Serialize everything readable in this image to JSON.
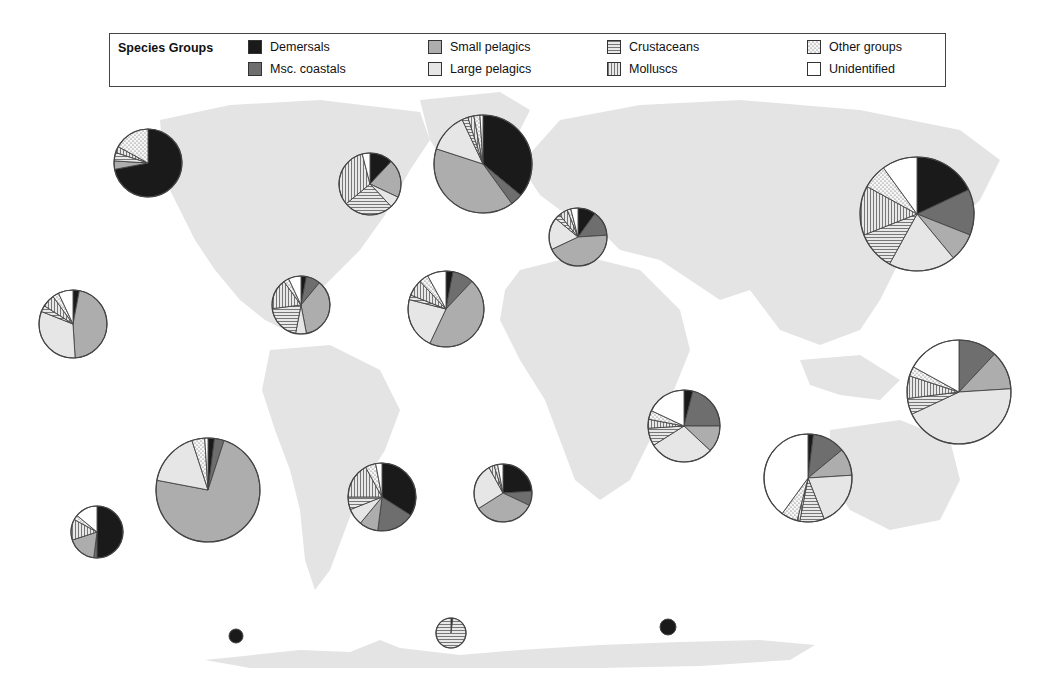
{
  "legend": {
    "title": "Species Groups",
    "items": [
      {
        "key": "dem",
        "label": "Demersals",
        "pattern": "solid",
        "color": "#1a1a1a",
        "col": 0,
        "row": 0
      },
      {
        "key": "msc",
        "label": "Msc. coastals",
        "pattern": "solid",
        "color": "#6e6e6e",
        "col": 0,
        "row": 1
      },
      {
        "key": "spel",
        "label": "Small pelagics",
        "pattern": "solid",
        "color": "#adadad",
        "col": 1,
        "row": 0
      },
      {
        "key": "lpel",
        "label": "Large pelagics",
        "pattern": "solid",
        "color": "#e6e6e6",
        "col": 1,
        "row": 1
      },
      {
        "key": "crus",
        "label": "Crustaceans",
        "pattern": "hlines",
        "color": "#bdbdbd",
        "col": 2,
        "row": 0
      },
      {
        "key": "moll",
        "label": "Molluscs",
        "pattern": "vlines",
        "color": "#bdbdbd",
        "col": 2,
        "row": 1
      },
      {
        "key": "oth",
        "label": "Other groups",
        "pattern": "dots",
        "color": "#efefef",
        "col": 3,
        "row": 0
      },
      {
        "key": "unid",
        "label": "Unidentified",
        "pattern": "solid",
        "color": "#ffffff",
        "col": 3,
        "row": 1
      }
    ]
  },
  "colors": {
    "land": "#e4e4e4",
    "pie_stroke": "#444444",
    "legend_border": "#444444"
  },
  "chart_data": {
    "type": "pie",
    "legend_position": "top",
    "categories": [
      "Demersals",
      "Msc. coastals",
      "Small pelagics",
      "Large pelagics",
      "Crustaceans",
      "Molluscs",
      "Other groups",
      "Unidentified"
    ],
    "pies": [
      {
        "area": "Arctic Sea / NE Pacific north",
        "cx": 148,
        "cy": 163,
        "r": 34,
        "values": {
          "dem": 72,
          "msc": 0,
          "spel": 4,
          "lpel": 0,
          "crus": 4,
          "moll": 3,
          "oth": 17,
          "unid": 0
        }
      },
      {
        "area": "NW Atlantic",
        "cx": 370,
        "cy": 184,
        "r": 31,
        "values": {
          "dem": 12,
          "msc": 0,
          "spel": 20,
          "lpel": 6,
          "crus": 26,
          "moll": 32,
          "oth": 0,
          "unid": 4
        }
      },
      {
        "area": "NE Atlantic",
        "cx": 483,
        "cy": 164,
        "r": 49,
        "values": {
          "dem": 36,
          "msc": 4,
          "spel": 40,
          "lpel": 13,
          "crus": 2,
          "moll": 2,
          "oth": 2,
          "unid": 1
        }
      },
      {
        "area": "Mediterranean & Black Sea",
        "cx": 578,
        "cy": 237,
        "r": 29,
        "values": {
          "dem": 10,
          "msc": 14,
          "spel": 44,
          "lpel": 18,
          "crus": 3,
          "moll": 5,
          "oth": 2,
          "unid": 4
        }
      },
      {
        "area": "NW Pacific",
        "cx": 917,
        "cy": 214,
        "r": 57,
        "values": {
          "dem": 18,
          "msc": 13,
          "spel": 8,
          "lpel": 19,
          "crus": 11,
          "moll": 14,
          "oth": 7,
          "unid": 10
        }
      },
      {
        "area": "NE Pacific",
        "cx": 73,
        "cy": 324,
        "r": 34,
        "values": {
          "dem": 3,
          "msc": 0,
          "spel": 46,
          "lpel": 32,
          "crus": 3,
          "moll": 6,
          "oth": 3,
          "unid": 7
        }
      },
      {
        "area": "Western Central Atlantic",
        "cx": 301,
        "cy": 305,
        "r": 29,
        "values": {
          "dem": 3,
          "msc": 8,
          "spel": 36,
          "lpel": 6,
          "crus": 20,
          "moll": 17,
          "oth": 3,
          "unid": 7
        }
      },
      {
        "area": "Eastern Central Atlantic",
        "cx": 446,
        "cy": 309,
        "r": 38,
        "values": {
          "dem": 3,
          "msc": 9,
          "spel": 45,
          "lpel": 22,
          "crus": 2,
          "moll": 7,
          "oth": 4,
          "unid": 8
        }
      },
      {
        "area": "Western Indian Ocean",
        "cx": 684,
        "cy": 426,
        "r": 36,
        "values": {
          "dem": 4,
          "msc": 21,
          "spel": 12,
          "lpel": 29,
          "crus": 8,
          "moll": 4,
          "oth": 4,
          "unid": 18
        }
      },
      {
        "area": "Eastern Indian Ocean",
        "cx": 959,
        "cy": 392,
        "r": 52,
        "values": {
          "dem": 0,
          "msc": 12,
          "spel": 12,
          "lpel": 44,
          "crus": 5,
          "moll": 7,
          "oth": 3,
          "unid": 17
        }
      },
      {
        "area": "Eastern Central Pacific",
        "cx": 208,
        "cy": 490,
        "r": 52,
        "values": {
          "dem": 2,
          "msc": 3,
          "spel": 73,
          "lpel": 17,
          "crus": 0,
          "moll": 0,
          "oth": 4,
          "unid": 1
        }
      },
      {
        "area": "SW Atlantic",
        "cx": 382,
        "cy": 497,
        "r": 34,
        "values": {
          "dem": 34,
          "msc": 18,
          "spel": 9,
          "lpel": 8,
          "crus": 6,
          "moll": 17,
          "oth": 5,
          "unid": 3
        }
      },
      {
        "area": "SE Atlantic",
        "cx": 503,
        "cy": 493,
        "r": 29,
        "values": {
          "dem": 24,
          "msc": 8,
          "spel": 34,
          "lpel": 26,
          "crus": 0,
          "moll": 3,
          "oth": 2,
          "unid": 3
        }
      },
      {
        "area": "Western Central Pacific / Southern Indian",
        "cx": 808,
        "cy": 478,
        "r": 44,
        "values": {
          "dem": 2,
          "msc": 12,
          "spel": 10,
          "lpel": 20,
          "crus": 9,
          "moll": 1,
          "oth": 6,
          "unid": 40
        }
      },
      {
        "area": "SE Pacific",
        "cx": 97,
        "cy": 532,
        "r": 26,
        "values": {
          "dem": 50,
          "msc": 2,
          "spel": 18,
          "lpel": 0,
          "crus": 0,
          "moll": 13,
          "oth": 3,
          "unid": 14
        }
      },
      {
        "area": "Antarctic Pacific",
        "cx": 236,
        "cy": 636,
        "r": 7,
        "values": {
          "dem": 100,
          "msc": 0,
          "spel": 0,
          "lpel": 0,
          "crus": 0,
          "moll": 0,
          "oth": 0,
          "unid": 0
        }
      },
      {
        "area": "Antarctic Atlantic",
        "cx": 451,
        "cy": 633,
        "r": 15,
        "values": {
          "dem": 2,
          "msc": 0,
          "spel": 0,
          "lpel": 0,
          "crus": 98,
          "moll": 0,
          "oth": 0,
          "unid": 0
        }
      },
      {
        "area": "Antarctic Indian",
        "cx": 668,
        "cy": 627,
        "r": 8,
        "values": {
          "dem": 100,
          "msc": 0,
          "spel": 0,
          "lpel": 0,
          "crus": 0,
          "moll": 0,
          "oth": 0,
          "unid": 0
        }
      }
    ]
  }
}
